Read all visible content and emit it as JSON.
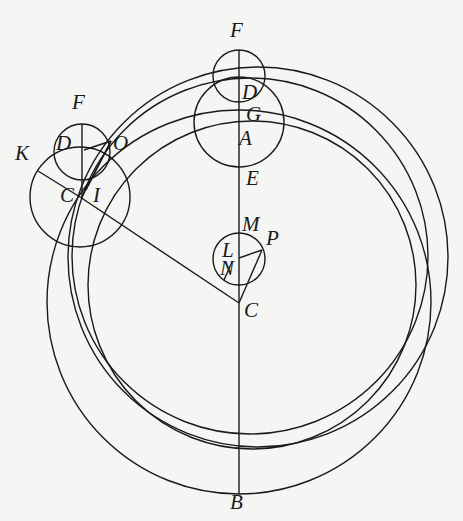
{
  "diagram": {
    "type": "geometric construction (epicycle / eccentric circles)",
    "stroke_color": "#1a1a1a",
    "background": "#f5f5f3",
    "labels": [
      {
        "id": "F_top",
        "text": "F",
        "x": 230,
        "y": 20
      },
      {
        "id": "D_top",
        "text": "D",
        "x": 242,
        "y": 82
      },
      {
        "id": "G",
        "text": "G",
        "x": 246,
        "y": 104
      },
      {
        "id": "A",
        "text": "A",
        "x": 239,
        "y": 128
      },
      {
        "id": "E",
        "text": "E",
        "x": 246,
        "y": 168
      },
      {
        "id": "M",
        "text": "M",
        "x": 242,
        "y": 214
      },
      {
        "id": "P",
        "text": "P",
        "x": 266,
        "y": 228
      },
      {
        "id": "L",
        "text": "L",
        "x": 222,
        "y": 240
      },
      {
        "id": "N",
        "text": "N",
        "x": 220,
        "y": 258
      },
      {
        "id": "C_center",
        "text": "C",
        "x": 244,
        "y": 300
      },
      {
        "id": "B",
        "text": "B",
        "x": 230,
        "y": 492
      },
      {
        "id": "F_left",
        "text": "F",
        "x": 72,
        "y": 92
      },
      {
        "id": "D_left",
        "text": "D",
        "x": 56,
        "y": 133
      },
      {
        "id": "O",
        "text": "O",
        "x": 113,
        "y": 133
      },
      {
        "id": "K",
        "text": "K",
        "x": 15,
        "y": 143
      },
      {
        "id": "C_left",
        "text": "C",
        "x": 60,
        "y": 185
      },
      {
        "id": "I",
        "text": "I",
        "x": 93,
        "y": 185
      }
    ],
    "circles": [
      {
        "id": "small-top-F",
        "cx": 239,
        "cy": 76,
        "r": 26
      },
      {
        "id": "circle-GA",
        "cx": 239,
        "cy": 122,
        "r": 45
      },
      {
        "id": "small-left-D",
        "cx": 82,
        "cy": 152,
        "r": 28
      },
      {
        "id": "circle-left-C",
        "cx": 80,
        "cy": 197,
        "r": 50
      },
      {
        "id": "small-L",
        "cx": 239,
        "cy": 259,
        "r": 26
      },
      {
        "id": "large-B",
        "cx": 239,
        "cy": 302,
        "r": 192
      },
      {
        "id": "large-outer-right",
        "cx": 258,
        "cy": 257,
        "r": 190
      },
      {
        "id": "large-middle",
        "cx": 250,
        "cy": 256,
        "r": 178
      },
      {
        "id": "large-inner",
        "cx": 252,
        "cy": 285,
        "r": 164
      }
    ],
    "lines": [
      {
        "id": "axis-FB",
        "x1": 239,
        "y1": 50,
        "x2": 239,
        "y2": 494
      },
      {
        "id": "left-vertical-FC",
        "x1": 82,
        "y1": 124,
        "x2": 82,
        "y2": 197
      },
      {
        "id": "C-to-Cleft",
        "x1": 239,
        "y1": 303,
        "x2": 80,
        "y2": 197
      },
      {
        "id": "K-line",
        "x1": 38,
        "y1": 171,
        "x2": 80,
        "y2": 197
      },
      {
        "id": "D-to-O",
        "x1": 84,
        "y1": 150,
        "x2": 111,
        "y2": 141
      },
      {
        "id": "O-to-C1",
        "x1": 111,
        "y1": 141,
        "x2": 82,
        "y2": 197
      },
      {
        "id": "O-to-C2",
        "x1": 111,
        "y1": 141,
        "x2": 86,
        "y2": 190
      },
      {
        "id": "L-to-P",
        "x1": 239,
        "y1": 258,
        "x2": 262,
        "y2": 250
      },
      {
        "id": "P-to-C",
        "x1": 262,
        "y1": 250,
        "x2": 239,
        "y2": 303
      },
      {
        "id": "N-chord",
        "x1": 224,
        "y1": 280,
        "x2": 232,
        "y2": 262
      }
    ]
  }
}
